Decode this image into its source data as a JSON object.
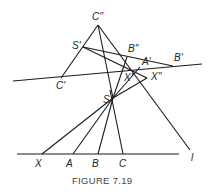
{
  "figure": {
    "caption": "FIGURE 7.19"
  },
  "labels": {
    "C2": "C''",
    "S1": "S'",
    "B2": "B''",
    "A1": "A'",
    "B1": "B'",
    "C1": "C'",
    "X1": "X'",
    "X2": "X''",
    "S": "S",
    "l": "l",
    "X": "X",
    "A": "A",
    "B": "B",
    "C": "C"
  },
  "colors": {
    "line": "#1a1a1a",
    "caption": "#444444"
  }
}
